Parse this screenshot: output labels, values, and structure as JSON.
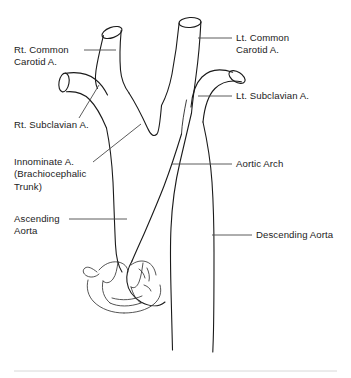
{
  "figure": {
    "background_color": "#ffffff",
    "line_color": "#1a1a1a",
    "leader_color": "#4a4a4a",
    "width": 351,
    "height": 378
  },
  "labels": {
    "rt_common_carotid": "Rt. Common\nCarotid A.",
    "lt_common_carotid": "Lt. Common\nCarotid A.",
    "rt_subclavian": "Rt. Subclavian A.",
    "lt_subclavian": "Lt. Subclavian A.",
    "innominate": "Innominate A.\n(Brachiocephalic\nTrunk)",
    "aortic_arch": "Aortic Arch",
    "ascending_aorta": "Ascending\nAorta",
    "descending_aorta": "Descending Aorta"
  },
  "structures": [
    {
      "name": "rt-common-carotid-artery",
      "side": "right",
      "type": "branch-vessel"
    },
    {
      "name": "lt-common-carotid-artery",
      "side": "left",
      "type": "branch-vessel"
    },
    {
      "name": "rt-subclavian-artery",
      "side": "right",
      "type": "branch-vessel"
    },
    {
      "name": "lt-subclavian-artery",
      "side": "left",
      "type": "branch-vessel"
    },
    {
      "name": "innominate-artery",
      "side": "right",
      "type": "trunk-vessel"
    },
    {
      "name": "aortic-arch",
      "side": "center",
      "type": "arch"
    },
    {
      "name": "ascending-aorta",
      "side": "right",
      "type": "trunk-vessel"
    },
    {
      "name": "descending-aorta",
      "side": "left",
      "type": "trunk-vessel"
    },
    {
      "name": "aortic-valve-and-sinuses",
      "side": "center",
      "type": "valve"
    }
  ]
}
